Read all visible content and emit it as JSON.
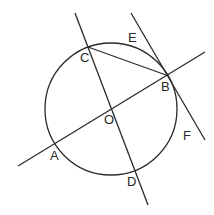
{
  "diagram": {
    "type": "geometry",
    "stroke_color": "#2a2a2a",
    "circle": {
      "name": "circle-O",
      "cx": 111,
      "cy": 109,
      "r": 66
    },
    "lines": [
      {
        "name": "line-CD",
        "x1": 75,
        "y1": 13,
        "x2": 148,
        "y2": 205
      },
      {
        "name": "line-AB",
        "x1": 18,
        "y1": 166,
        "x2": 205,
        "y2": 52
      },
      {
        "name": "tangent-EF",
        "x1": 131,
        "y1": 13,
        "x2": 205,
        "y2": 140
      },
      {
        "name": "chord-CB",
        "x1": 88,
        "y1": 47,
        "x2": 166,
        "y2": 75
      }
    ],
    "labels": {
      "C": "C",
      "E": "E",
      "B": "B",
      "O": "O",
      "A": "A",
      "D": "D",
      "F": "F"
    }
  }
}
